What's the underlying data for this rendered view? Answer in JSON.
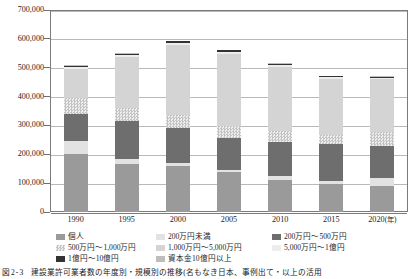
{
  "chart_data": {
    "type": "bar",
    "stacked": true,
    "title": "",
    "xlabel": "年",
    "ylabel": "",
    "ylim": [
      0,
      700000
    ],
    "ytick_step": 100000,
    "grid": true,
    "legend_position": "bottom",
    "categories": [
      "1990",
      "1995",
      "2000",
      "2005",
      "2010",
      "2015",
      "2020"
    ],
    "x_tick_labels": [
      "1990",
      "1995",
      "2000",
      "2005",
      "2010",
      "2015",
      "2020(年)"
    ],
    "y_tick_labels": [
      "0",
      "100,000",
      "200,000",
      "300,000",
      "400,000",
      "500,000",
      "600,000",
      "700,000"
    ],
    "y_tick_values": [
      0,
      100000,
      200000,
      300000,
      400000,
      500000,
      600000,
      700000
    ],
    "series": [
      {
        "name": "個人",
        "color": "#9a9a9a",
        "pattern": "solid",
        "values": [
          200000,
          166000,
          160000,
          138000,
          112000,
          96000,
          92000
        ]
      },
      {
        "name": "200万円未満",
        "color": "#e2e2e2",
        "pattern": "solid",
        "values": [
          48000,
          18000,
          9000,
          8000,
          12000,
          11000,
          25000
        ]
      },
      {
        "name": "200万円～500万円",
        "color": "#6e6e6e",
        "pattern": "solid",
        "values": [
          92000,
          131000,
          122000,
          112000,
          120000,
          129000,
          112000
        ]
      },
      {
        "name": "500万円～1,000万円",
        "color": "#c3c3c3",
        "pattern": "checker",
        "values": [
          54000,
          45000,
          44000,
          42000,
          37000,
          32000,
          50000
        ]
      },
      {
        "name": "1,000万円～5,000万円",
        "color": "#d4d4d4",
        "pattern": "solid",
        "values": [
          102000,
          178000,
          246000,
          249000,
          223000,
          195000,
          183000
        ]
      },
      {
        "name": "5,000万円～1億円",
        "color": "#ededed",
        "pattern": "solid",
        "values": [
          6000,
          6000,
          6000,
          6000,
          5000,
          4000,
          4000
        ]
      },
      {
        "name": "1億円～10億円",
        "color": "#333333",
        "pattern": "solid",
        "values": [
          4000,
          5000,
          5000,
          6000,
          5000,
          4000,
          4000
        ]
      },
      {
        "name": "資本金10億円以上",
        "color": "#bdbdbd",
        "pattern": "solid",
        "values": [
          2000,
          2000,
          2000,
          2000,
          2000,
          2000,
          1000
        ]
      }
    ],
    "totals": [
      508000,
      551000,
      594000,
      563000,
      516000,
      473000,
      471000
    ]
  },
  "axis": {
    "y_labels": [
      "700,000",
      "600,000",
      "500,000",
      "400,000",
      "300,000",
      "200,000",
      "100,000",
      "0"
    ],
    "x_labels": [
      {
        "year": "1990",
        "unit": ""
      },
      {
        "year": "1995",
        "unit": ""
      },
      {
        "year": "2000",
        "unit": ""
      },
      {
        "year": "2005",
        "unit": ""
      },
      {
        "year": "2010",
        "unit": ""
      },
      {
        "year": "2015",
        "unit": ""
      },
      {
        "year": "2020",
        "unit": "(年)"
      }
    ]
  },
  "legend": {
    "items": [
      {
        "label": "個人",
        "color": "#9a9a9a"
      },
      {
        "label": "200万円未満",
        "color": "#e2e2e2"
      },
      {
        "label": "200万円～500万円",
        "color": "#6e6e6e"
      },
      {
        "label": "500万円～1,000万円",
        "color": "#c3c3c3"
      },
      {
        "label": "1,000万円～5,000万円",
        "color": "#d4d4d4"
      },
      {
        "label": "5,000万円～1億円",
        "color": "#ededed"
      },
      {
        "label": "1億円～10億円",
        "color": "#333333"
      },
      {
        "label": "資本金10億円以上",
        "color": "#bdbdbd"
      }
    ]
  },
  "caption": {
    "number": "図2-3",
    "text": "建設業許可業者数の年度別・規模別の推移(名もなき日本、事例出て・以上の活用"
  }
}
